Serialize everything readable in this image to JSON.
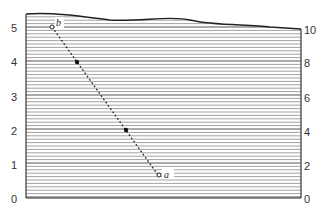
{
  "chart_data": {
    "type": "line",
    "title": "",
    "xlabel": "",
    "ylabel": "",
    "left_axis": {
      "ticks": [
        "0",
        "1",
        "2",
        "3",
        "4",
        "5"
      ],
      "range": [
        0,
        5.4
      ]
    },
    "right_axis": {
      "ticks": [
        "0",
        "2",
        "4",
        "6",
        "8",
        "10"
      ],
      "range": [
        0,
        10.8
      ]
    },
    "grid": "dense horizontal hatch lines",
    "series": [
      {
        "name": "b-a line",
        "style": "dashed",
        "points": [
          {
            "label": "b",
            "x": 0.09,
            "y": 5.05
          },
          {
            "label": "",
            "x": 0.18,
            "y": 4.0
          },
          {
            "label": "",
            "x": 0.36,
            "y": 2.0
          },
          {
            "label": "a",
            "x": 0.48,
            "y": 0.7
          }
        ]
      }
    ],
    "annotations": [
      "b",
      "a"
    ]
  },
  "labels": {
    "left": [
      "5",
      "4",
      "3",
      "2",
      "1",
      "0"
    ],
    "right": [
      "10",
      "8",
      "6",
      "4",
      "2",
      "0"
    ],
    "point_top": "b",
    "point_bottom": "a"
  }
}
